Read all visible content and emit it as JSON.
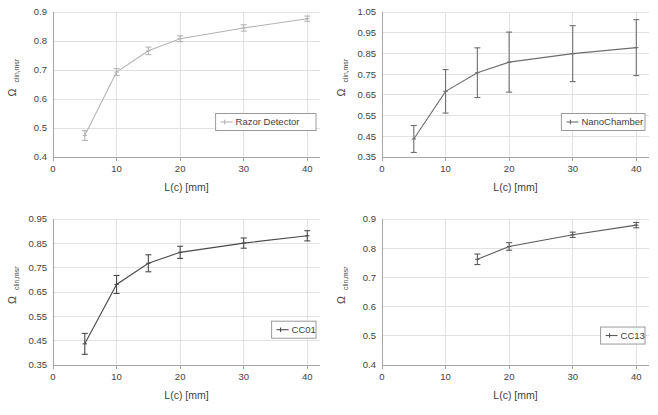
{
  "figure": {
    "layout": "2x2 grid of line charts with error bars",
    "background_color": "#ffffff",
    "grid_color": "#e2e2e2",
    "axis_color": "#a6a6a6",
    "text_color": "#3f3f3f"
  },
  "axis_titles": {
    "x": "L(c) [mm]",
    "y_main": "Ω",
    "y_sub": "clin,msr"
  },
  "chart_data": [
    {
      "type": "line",
      "id": "razor-detector",
      "title": "",
      "xlabel": "L(c) [mm]",
      "ylabel": "Ωclin,msr",
      "legend": "Razor Detector",
      "legend_position": "inside-right-lower",
      "grid": true,
      "line_color": "#b4b4b4",
      "x": [
        5,
        10,
        15,
        20,
        30,
        40
      ],
      "values": [
        0.474,
        0.693,
        0.766,
        0.808,
        0.845,
        0.877
      ],
      "errors": [
        0.017,
        0.012,
        0.013,
        0.01,
        0.011,
        0.009
      ],
      "xlim": [
        0,
        42
      ],
      "ylim": [
        0.4,
        0.9
      ],
      "xticks": [
        0,
        10,
        20,
        30,
        40
      ],
      "yticks": [
        0.4,
        0.5,
        0.6,
        0.7,
        0.8,
        0.9
      ],
      "ytick_labels": [
        "0.4",
        "0.5",
        "0.6",
        "0.7",
        "0.8",
        "0.9"
      ],
      "xtick_labels": [
        "0",
        "10",
        "20",
        "30",
        "40"
      ]
    },
    {
      "type": "line",
      "id": "nanochamber",
      "title": "",
      "xlabel": "L(c) [mm]",
      "ylabel": "Ωclin,msr",
      "legend": "NanoChamber",
      "legend_position": "inside-right-lower",
      "grid": true,
      "line_color": "#6e6e6e",
      "x": [
        5,
        10,
        15,
        20,
        30,
        40
      ],
      "values": [
        0.437,
        0.667,
        0.757,
        0.808,
        0.849,
        0.878
      ],
      "errors": [
        0.065,
        0.105,
        0.12,
        0.145,
        0.135,
        0.135
      ],
      "xlim": [
        0,
        42
      ],
      "ylim": [
        0.35,
        1.05
      ],
      "xticks": [
        0,
        10,
        20,
        30,
        40
      ],
      "yticks": [
        0.35,
        0.45,
        0.55,
        0.65,
        0.75,
        0.85,
        0.95,
        1.05
      ],
      "ytick_labels": [
        "0.35",
        "0.45",
        "0.55",
        "0.65",
        "0.75",
        "0.85",
        "0.95",
        "1.05"
      ],
      "xtick_labels": [
        "0",
        "10",
        "20",
        "30",
        "40"
      ]
    },
    {
      "type": "line",
      "id": "cc01",
      "title": "",
      "xlabel": "L(c) [mm]",
      "ylabel": "Ωclin,msr",
      "legend": "CC01",
      "legend_position": "inside-right-lower",
      "grid": true,
      "line_color": "#4a4a4a",
      "x": [
        5,
        10,
        15,
        20,
        30,
        40
      ],
      "values": [
        0.437,
        0.681,
        0.768,
        0.813,
        0.851,
        0.881
      ],
      "errors": [
        0.043,
        0.037,
        0.035,
        0.025,
        0.021,
        0.021
      ],
      "xlim": [
        0,
        42
      ],
      "ylim": [
        0.35,
        0.95
      ],
      "xticks": [
        0,
        10,
        20,
        30,
        40
      ],
      "yticks": [
        0.35,
        0.45,
        0.55,
        0.65,
        0.75,
        0.85,
        0.95
      ],
      "ytick_labels": [
        "0.35",
        "0.45",
        "0.55",
        "0.65",
        "0.75",
        "0.85",
        "0.95"
      ],
      "xtick_labels": [
        "0",
        "10",
        "20",
        "30",
        "40"
      ]
    },
    {
      "type": "line",
      "id": "cc13",
      "title": "",
      "xlabel": "L(c) [mm]",
      "ylabel": "Ωclin,msr",
      "legend": "CC13",
      "legend_position": "inside-right-lower",
      "grid": true,
      "line_color": "#5a5a5a",
      "x": [
        15,
        20,
        30,
        40
      ],
      "values": [
        0.762,
        0.806,
        0.846,
        0.879
      ],
      "errors": [
        0.018,
        0.013,
        0.009,
        0.009
      ],
      "xlim": [
        0,
        42
      ],
      "ylim": [
        0.4,
        0.9
      ],
      "xticks": [
        0,
        10,
        20,
        30,
        40
      ],
      "yticks": [
        0.4,
        0.5,
        0.6,
        0.7,
        0.8,
        0.9
      ],
      "ytick_labels": [
        "0.4",
        "0.5",
        "0.6",
        "0.7",
        "0.8",
        "0.9"
      ],
      "xtick_labels": [
        "0",
        "10",
        "20",
        "30",
        "40"
      ]
    }
  ]
}
